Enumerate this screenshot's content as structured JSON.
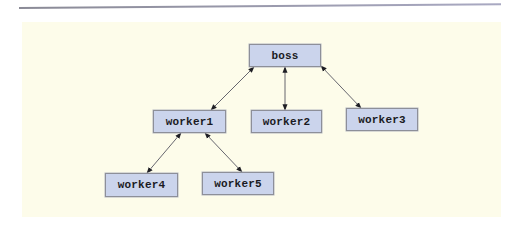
{
  "diagram": {
    "type": "tree",
    "colors": {
      "panel_background": "#fdfcea",
      "node_fill": "#cbd4ec",
      "node_border": "#8d8f99",
      "edge": "#555560",
      "rule": "#9a9ab0"
    },
    "nodes": [
      {
        "id": "boss",
        "label": "boss",
        "x": 249,
        "y": 44,
        "w": 72,
        "h": 23
      },
      {
        "id": "worker1",
        "label": "worker1",
        "x": 153,
        "y": 110,
        "w": 73,
        "h": 23
      },
      {
        "id": "worker2",
        "label": "worker2",
        "x": 251,
        "y": 110,
        "w": 71,
        "h": 23
      },
      {
        "id": "worker3",
        "label": "worker3",
        "x": 346,
        "y": 108,
        "w": 72,
        "h": 23
      },
      {
        "id": "worker4",
        "label": "worker4",
        "x": 105,
        "y": 173,
        "w": 73,
        "h": 24
      },
      {
        "id": "worker5",
        "label": "worker5",
        "x": 202,
        "y": 172,
        "w": 72,
        "h": 23
      }
    ],
    "edges": [
      {
        "from": "boss",
        "to": "worker1",
        "bidirectional": true,
        "x1": 254,
        "y1": 67,
        "x2": 211,
        "y2": 110
      },
      {
        "from": "boss",
        "to": "worker2",
        "bidirectional": true,
        "x1": 285,
        "y1": 67,
        "x2": 285,
        "y2": 110
      },
      {
        "from": "boss",
        "to": "worker3",
        "bidirectional": true,
        "x1": 321,
        "y1": 66,
        "x2": 361,
        "y2": 108
      },
      {
        "from": "worker1",
        "to": "worker4",
        "bidirectional": true,
        "x1": 181,
        "y1": 133,
        "x2": 147,
        "y2": 173
      },
      {
        "from": "worker1",
        "to": "worker5",
        "bidirectional": true,
        "x1": 205,
        "y1": 133,
        "x2": 242,
        "y2": 172
      }
    ]
  }
}
